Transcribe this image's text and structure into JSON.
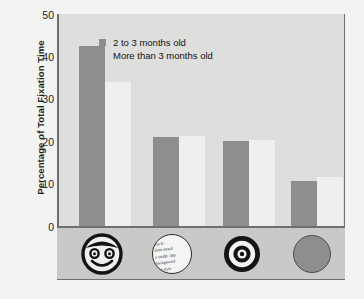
{
  "chart_data": {
    "type": "bar",
    "title": "",
    "xlabel": "",
    "ylabel": "Percentage of Total Fixation Time",
    "ylim": [
      0,
      50
    ],
    "yticks": [
      0,
      10,
      20,
      30,
      40,
      50
    ],
    "grid": false,
    "legend_position": "upper-center",
    "categories": [
      "face",
      "text-pattern",
      "bullseye",
      "plain-disk"
    ],
    "category_icons": [
      "smiley-face-icon",
      "text-circle-icon",
      "bullseye-icon",
      "plain-disk-icon"
    ],
    "series": [
      {
        "name": "2 to 3 months old",
        "values": [
          42.5,
          21.0,
          20.0,
          10.5
        ],
        "color": "#8e8e8e"
      },
      {
        "name": "More than 3 months old",
        "values": [
          34.0,
          21.2,
          20.2,
          11.5
        ],
        "color": "#efefed"
      }
    ]
  },
  "axis": {
    "y_title": "Percentage of Total Fixation Time",
    "tick_labels": [
      "50",
      "40",
      "30",
      "20",
      "10",
      "0"
    ]
  },
  "legend": {
    "entries": [
      {
        "label": "2 to 3 months old"
      },
      {
        "label": "More than 3 months old"
      }
    ]
  },
  "stimuli": {
    "text_circle_lines": [
      "ima 8>",
      "dette attach",
      "n width: 30p",
      "background",
      "ical style"
    ]
  },
  "colors": {
    "bar_dark": "#8e8e8e",
    "bar_light": "#efefed",
    "plot_background": "#dededc",
    "strip_background": "#c9c9c7",
    "page_background": "#f3f3f1",
    "axis": "#6f6f6f",
    "text": "#1d1d1d"
  }
}
